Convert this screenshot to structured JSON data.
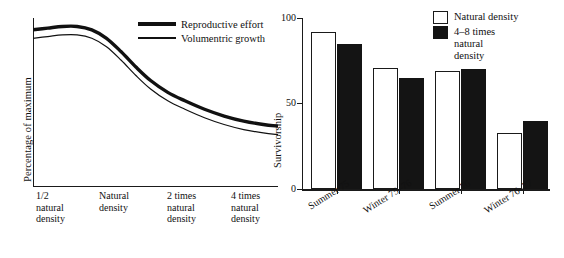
{
  "chart_data": [
    {
      "type": "line",
      "title": "",
      "xlabel": "",
      "ylabel": "Percentage of maximum",
      "categories": [
        "1/2 natural density",
        "Natural density",
        "2 times natural density",
        "4 times natural density"
      ],
      "category_lines": [
        [
          "1/2",
          "natural",
          "density"
        ],
        [
          "Natural",
          "density"
        ],
        [
          "2 times",
          "natural",
          "density"
        ],
        [
          "4 times",
          "natural",
          "density"
        ]
      ],
      "grid": false,
      "axis_ticks": false,
      "legend_position": "top-right",
      "series": [
        {
          "name": "Reproductive effort",
          "style": "thick",
          "x": [
            0,
            6,
            12,
            18,
            24,
            30,
            36,
            42,
            48,
            55,
            62,
            70,
            78,
            86,
            94,
            100
          ],
          "values": [
            93,
            94,
            95,
            95,
            93,
            88,
            80,
            71,
            63,
            56,
            51,
            46,
            42,
            39,
            37,
            36
          ]
        },
        {
          "name": "Volumentric growth",
          "style": "thin",
          "x": [
            0,
            6,
            12,
            18,
            24,
            30,
            36,
            42,
            48,
            55,
            62,
            70,
            78,
            86,
            94,
            100
          ],
          "values": [
            88,
            89,
            90,
            90,
            88,
            83,
            75,
            66,
            58,
            51,
            46,
            41,
            37,
            34,
            32,
            31
          ]
        }
      ]
    },
    {
      "type": "bar",
      "title": "",
      "xlabel": "",
      "ylabel": "Survivorship",
      "ylim": [
        0,
        100
      ],
      "yticks": [
        0,
        50,
        100
      ],
      "ytick_labels": [
        "0",
        "50",
        "100"
      ],
      "grid": false,
      "legend_position": "top-right",
      "categories": [
        "Summer 75",
        "Winter 75–76",
        "Summer 76",
        "Winter 76–77"
      ],
      "series": [
        {
          "name": "Natural density",
          "style": "open",
          "values": [
            92,
            71,
            69,
            33
          ]
        },
        {
          "name": "4–8 times natural density",
          "style": "filled",
          "values": [
            85,
            65,
            70,
            40
          ]
        }
      ],
      "legend_entries": [
        {
          "label": "Natural density",
          "lines": [
            "Natural density"
          ],
          "style": "open"
        },
        {
          "label": "4–8 times natural density",
          "lines": [
            "4–8 times",
            "natural",
            "density"
          ],
          "style": "filled"
        }
      ]
    }
  ],
  "left_chart": {
    "ylabel": "Percentage of maximum",
    "legend": [
      {
        "label": "Reproductive effort",
        "style": "thick"
      },
      {
        "label": "Volumentric growth",
        "style": "thin"
      }
    ],
    "xticks": [
      {
        "l1": "1/2",
        "l2": "natural",
        "l3": "density"
      },
      {
        "l1": "Natural",
        "l2": "density",
        "l3": ""
      },
      {
        "l1": "2 times",
        "l2": "natural",
        "l3": "density"
      },
      {
        "l1": "4 times",
        "l2": "natural",
        "l3": "density"
      }
    ]
  },
  "right_chart": {
    "ylabel": "Survivorship",
    "ytick_labels": [
      "100",
      "50",
      "0"
    ],
    "categories": [
      "Summer 75",
      "Winter 75–76",
      "Summer 76",
      "Winter 76–77"
    ],
    "legend": [
      {
        "l1": "Natural density",
        "l2": "",
        "l3": "",
        "style": "open"
      },
      {
        "l1": "4–8 times",
        "l2": "natural",
        "l3": "density",
        "style": "filled"
      }
    ]
  },
  "colors": {
    "ink": "#1a1a1a",
    "fill": "#141414",
    "background": "#ffffff"
  }
}
